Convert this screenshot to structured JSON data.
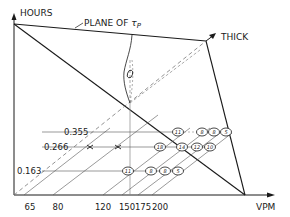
{
  "diagram": {
    "axes": {
      "y_label": "HOURS",
      "x_label": "VPM",
      "z_label": "THICK"
    },
    "plane_label": "PLANE OF",
    "plane_symbol": "τ",
    "plane_subscript": "P",
    "contour_label": "0",
    "x_ticks": [
      "65",
      "80",
      "120",
      "150",
      "175",
      "200"
    ],
    "thickness_levels": [
      "0.355",
      "0.266",
      "0.163"
    ],
    "rows": [
      {
        "level": "0.355",
        "values": [
          "11",
          "8",
          "8",
          "5"
        ]
      },
      {
        "level": "0.266",
        "values": [
          "18",
          "14",
          "12",
          "10"
        ]
      },
      {
        "level": "0.163",
        "values": [
          "11",
          "8",
          "8",
          "5"
        ]
      }
    ]
  }
}
